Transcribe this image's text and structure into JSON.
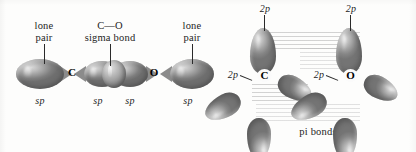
{
  "figure": {
    "background_color": "#fdfdfc",
    "orbital_color": "#9a9a9a",
    "text_color": "#242424"
  },
  "left_panel": {
    "name": "sigma-framework-panel",
    "labels": {
      "lone_pair_left_line1": "lone",
      "lone_pair_left_line2": "pair",
      "sigma_bond_line1": "C—O",
      "sigma_bond_line2": "sigma bond",
      "lone_pair_right_line1": "lone",
      "lone_pair_right_line2": "pair"
    },
    "atoms": [
      {
        "symbol": "C"
      },
      {
        "symbol": "O"
      }
    ],
    "hybrid_labels": [
      {
        "text": "sp"
      },
      {
        "text": "sp"
      },
      {
        "text": "sp"
      },
      {
        "text": "sp"
      }
    ]
  },
  "right_panel": {
    "name": "pi-bonding-panel",
    "labels": {
      "pi_bonds": "pi bonds"
    },
    "atoms": [
      {
        "symbol": "C"
      },
      {
        "symbol": "O"
      }
    ],
    "orbital_labels": [
      {
        "text": "2p",
        "position": "carbon-top"
      },
      {
        "text": "2p",
        "position": "carbon-left"
      },
      {
        "text": "2p",
        "position": "oxygen-top"
      },
      {
        "text": "2p",
        "position": "oxygen-left"
      }
    ]
  }
}
